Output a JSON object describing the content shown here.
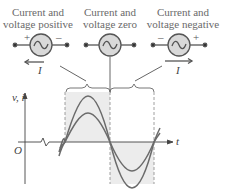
{
  "labels": {
    "positive": {
      "line1": "Current and",
      "line2": "voltage positive"
    },
    "zero": {
      "line1": "Current and",
      "line2": "voltage zero"
    },
    "negative": {
      "line1": "Current and",
      "line2": "voltage negative"
    }
  },
  "sources": [
    {
      "left_sign": "+",
      "right_sign": "–",
      "current_label": "I",
      "arrow_direction": "left"
    },
    {
      "left_sign": "",
      "right_sign": "",
      "current_label": "",
      "arrow_direction": "none"
    },
    {
      "left_sign": "–",
      "right_sign": "+",
      "current_label": "I",
      "arrow_direction": "right"
    }
  ],
  "graph": {
    "y_axis_label": "v, i",
    "x_axis_label": "t",
    "origin_label": "O"
  },
  "colors": {
    "line": "#6b6b6b",
    "shade": "#ececec",
    "source_fill": "#d9d9d9"
  }
}
